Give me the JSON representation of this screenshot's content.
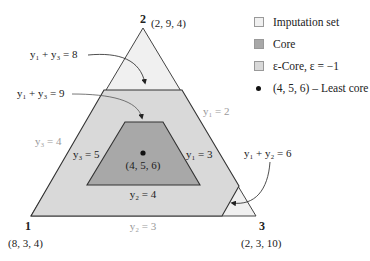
{
  "legend": {
    "items": [
      {
        "label": "Imputation set",
        "color": "#f0f0f0",
        "kind": "swatch"
      },
      {
        "label": "Core",
        "color": "#a8a8a8",
        "kind": "swatch"
      },
      {
        "label": "ε-Core, ε = −1",
        "color": "#d9d9d9",
        "kind": "swatch"
      },
      {
        "label": "(4, 5, 6) – Least core",
        "color": "#111111",
        "kind": "dot"
      }
    ]
  },
  "vertices": {
    "v1": {
      "label": "1",
      "coords": "(8, 3, 4)"
    },
    "v2": {
      "label": "2",
      "coords": "(2, 9, 4)"
    },
    "v3": {
      "label": "3",
      "coords": "(2, 3, 10)"
    }
  },
  "least_core": {
    "coords": "(4, 5, 6)"
  },
  "constraints": {
    "y1_y3_8": "y₁ + y₃ = 8",
    "y1_y3_9": "y₁ + y₃ = 9",
    "y1_y2_6": "y₁ + y₂ = 6",
    "y1_2": "y₁ = 2",
    "y1_3": "y₁ = 3",
    "y3_4": "y₃ = 4",
    "y3_5": "y₃ = 5",
    "y2_3": "y₂ = 3",
    "y2_4": "y₂ = 4"
  },
  "colors": {
    "imputation": "#f0f0f0",
    "epsilon_core": "#d9d9d9",
    "core": "#a8a8a8",
    "stroke": "#333333"
  }
}
